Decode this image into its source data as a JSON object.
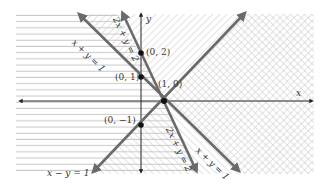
{
  "diagram": {
    "title": "",
    "type": "inequality-regions",
    "axes": {
      "x_label": "x",
      "y_label": "y",
      "origin_px": [
        141,
        101
      ],
      "unit_px": 23
    },
    "lines": [
      {
        "id": "line-x-plus-y",
        "equation": "x + y = 1",
        "color": "#6a6a6a"
      },
      {
        "id": "line-2x-plus-y",
        "equation": "2x + y = 2",
        "color": "#6a6a6a"
      },
      {
        "id": "line-x-minus-y",
        "equation": "x − y = 1",
        "color": "#6a6a6a"
      }
    ],
    "points": [
      {
        "label": "(0, 2)",
        "x": 0,
        "y": 2
      },
      {
        "label": "(0, 1)",
        "x": 0,
        "y": 1
      },
      {
        "label": "(1, 0)",
        "x": 1,
        "y": 0
      },
      {
        "label": "(0, −1)",
        "x": 0,
        "y": -1
      }
    ],
    "regions": [
      {
        "name": "2x + y ≤ 2",
        "pattern": "horizontal-lines"
      },
      {
        "name": "x + y ≥ 1",
        "pattern": "diagonal-forward"
      },
      {
        "name": "x − y ≥ 1",
        "pattern": "diagonal-back"
      }
    ],
    "colors": {
      "hatch": "#c8c8c8",
      "line": "#6a6a6a",
      "axis": "#222222",
      "point": "#111111"
    }
  }
}
